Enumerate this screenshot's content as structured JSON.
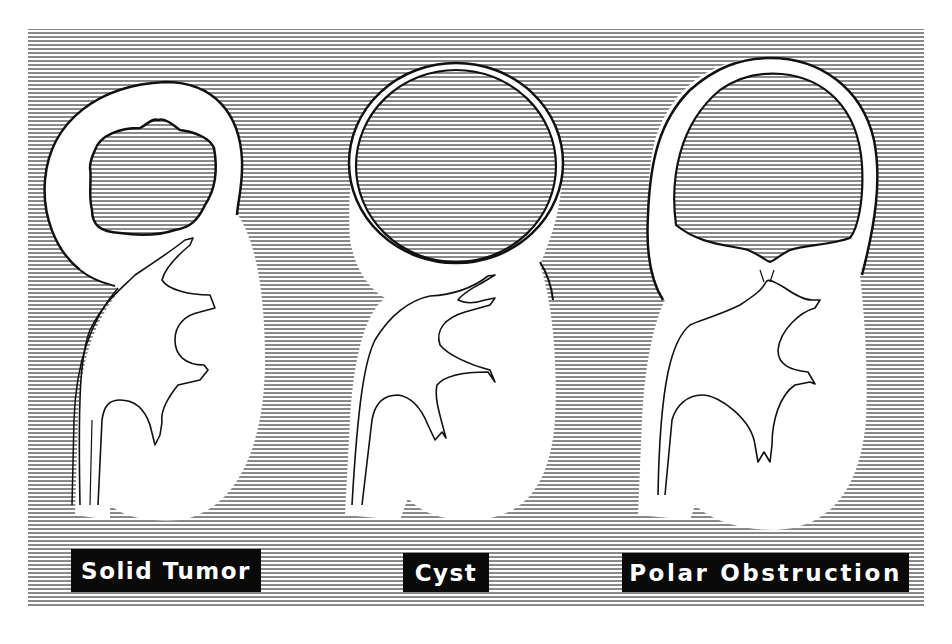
{
  "figure": {
    "colors": {
      "background": "#ffffff",
      "hatch_line": "#8a8a8a",
      "outline": "#111111",
      "tissue": "#ffffff",
      "label_bg": "#0a0a0a",
      "label_text": "#ffffff"
    },
    "hatch": {
      "orientation": "horizontal",
      "spacing_px": 4,
      "region": [
        28,
        29,
        924,
        608
      ]
    }
  },
  "panels": [
    {
      "id": "solid-tumor",
      "label": "Solid Tumor",
      "lesion": "irregular solid mass in upper pole"
    },
    {
      "id": "cyst",
      "label": "Cyst",
      "lesion": "thin-walled round cyst in upper pole"
    },
    {
      "id": "polar-obstruction",
      "label": "Polar Obstruction",
      "lesion": "dilated upper-pole calyx with narrowed infundibulum"
    }
  ]
}
